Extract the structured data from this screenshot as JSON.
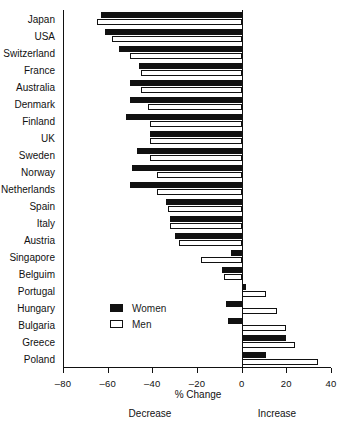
{
  "chart_data": {
    "type": "bar",
    "orientation": "horizontal",
    "title": "",
    "xlabel": "% Change",
    "ylabel": "",
    "xlim": [
      -80,
      40
    ],
    "xticks": [
      -80,
      -60,
      -40,
      -20,
      0,
      20,
      40
    ],
    "xtick_labels": [
      "–80",
      "–60",
      "–40",
      "–20",
      "0",
      "20",
      "40"
    ],
    "grid": false,
    "legend_position": "center-left",
    "annotations": {
      "left": "Decrease",
      "right": "Increase"
    },
    "categories": [
      "Japan",
      "USA",
      "Switzerland",
      "France",
      "Australia",
      "Denmark",
      "Finland",
      "UK",
      "Sweden",
      "Norway",
      "Netherlands",
      "Spain",
      "Italy",
      "Austria",
      "Singapore",
      "Belguim",
      "Portugal",
      "Hungary",
      "Bulgaria",
      "Greece",
      "Poland"
    ],
    "series": [
      {
        "name": "Women",
        "color": "#111111",
        "fill": "solid",
        "values": [
          -63,
          -61,
          -55,
          -46,
          -50,
          -50,
          -52,
          -41,
          -47,
          -49,
          -50,
          -34,
          -32,
          -30,
          -5,
          -9,
          2,
          -7,
          -6,
          20,
          11
        ]
      },
      {
        "name": "Men",
        "color": "#ffffff",
        "fill": "outline",
        "values": [
          -65,
          -58,
          -50,
          -45,
          -45,
          -42,
          -41,
          -41,
          -41,
          -38,
          -38,
          -33,
          -32,
          -28,
          -18,
          -8,
          11,
          16,
          20,
          24,
          34
        ]
      }
    ]
  },
  "legend": {
    "items": [
      {
        "label": "Women",
        "style": "filled"
      },
      {
        "label": "Men",
        "style": "outline"
      }
    ]
  },
  "axis": {
    "x_title": "% Change",
    "decrease_label": "Decrease",
    "increase_label": "Increase"
  }
}
